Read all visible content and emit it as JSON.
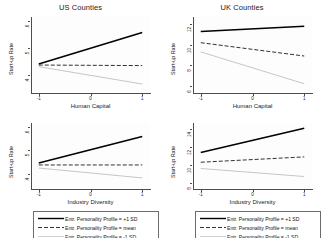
{
  "figure": {
    "background": "#ffffff",
    "panel_background": "#fdfdfd",
    "axis_color": "#4d4d4d"
  },
  "series_style": {
    "plus1sd": {
      "name": "+1 SD",
      "color": "#000000",
      "width": 1.5,
      "dash": "none"
    },
    "mean": {
      "name": "mean",
      "color": "#1a1a1a",
      "width": 0.9,
      "dash": "4 2"
    },
    "minus1sd": {
      "name": "-1 SD",
      "color": "#b8b8b8",
      "width": 0.8,
      "dash": "none"
    }
  },
  "legend": {
    "rows": [
      {
        "key": "solid-line-key",
        "label": "Entr. Personality Profile = +1 SD"
      },
      {
        "key": "dashed-line-key",
        "label": "Entr. Personality Profile = mean"
      },
      {
        "key": "light-line-key",
        "label": "Entr. Personality Profile = -1 SD"
      }
    ]
  },
  "chart_data": [
    {
      "id": "us-human-capital",
      "type": "line",
      "title": "US Counties",
      "xlabel": "Human Capital",
      "ylabel": "Start-up Rate",
      "x": [
        -1,
        1
      ],
      "xlim": [
        -1.15,
        1.15
      ],
      "xticks": [
        -1,
        0,
        1
      ],
      "xticklabels": [
        "-1",
        "0",
        "1"
      ],
      "ylim": [
        0.335,
        0.615
      ],
      "yticks": [
        0.4,
        0.5,
        0.6
      ],
      "yticklabels": [
        ".4",
        ".5",
        ".6"
      ],
      "grid": false,
      "series": [
        {
          "name": "Entr. Personality Profile = +1 SD",
          "style": "plus1sd",
          "values": [
            0.442,
            0.558
          ]
        },
        {
          "name": "Entr. Personality Profile = mean",
          "style": "mean",
          "values": [
            0.438,
            0.436
          ]
        },
        {
          "name": "Entr. Personality Profile = -1 SD",
          "style": "minus1sd",
          "values": [
            0.432,
            0.368
          ]
        }
      ]
    },
    {
      "id": "uk-human-capital",
      "type": "line",
      "title": "UK Counties",
      "xlabel": "Human Capital",
      "ylabel": "Start-up Rate",
      "x": [
        -1,
        1
      ],
      "xlim": [
        -1.15,
        1.15
      ],
      "xticks": [
        -1,
        0,
        1
      ],
      "xticklabels": [
        "-1",
        "0",
        "1"
      ],
      "ylim": [
        5.3,
        12.7
      ],
      "yticks": [
        6,
        8,
        10,
        12
      ],
      "yticklabels": [
        "6",
        "8",
        "10",
        "12"
      ],
      "grid": false,
      "series": [
        {
          "name": "Entr. Personality Profile = +1 SD",
          "style": "plus1sd",
          "values": [
            11.3,
            11.8
          ]
        },
        {
          "name": "Entr. Personality Profile = mean",
          "style": "mean",
          "values": [
            10.2,
            8.9
          ]
        },
        {
          "name": "Entr. Personality Profile = -1 SD",
          "style": "minus1sd",
          "values": [
            9.3,
            6.2
          ]
        }
      ]
    },
    {
      "id": "us-industry-diversity",
      "type": "line",
      "title": "",
      "xlabel": "Industry Diversity",
      "ylabel": "Start-up Rate",
      "x": [
        -1,
        1
      ],
      "xlim": [
        -1.15,
        1.15
      ],
      "xticks": [
        -1,
        0,
        1
      ],
      "xticklabels": [
        "-1",
        "0",
        "1"
      ],
      "ylim": [
        0.335,
        0.615
      ],
      "yticks": [
        0.4,
        0.5,
        0.6
      ],
      "yticklabels": [
        ".4",
        ".5",
        ".6"
      ],
      "grid": false,
      "series": [
        {
          "name": "Entr. Personality Profile = +1 SD",
          "style": "plus1sd",
          "values": [
            0.445,
            0.558
          ]
        },
        {
          "name": "Entr. Personality Profile = mean",
          "style": "mean",
          "values": [
            0.437,
            0.437
          ]
        },
        {
          "name": "Entr. Personality Profile = -1 SD",
          "style": "minus1sd",
          "values": [
            0.424,
            0.382
          ]
        }
      ]
    },
    {
      "id": "uk-industry-diversity",
      "type": "line",
      "title": "",
      "xlabel": "Industry Diversity",
      "ylabel": "Start-up Rate",
      "x": [
        -1,
        1
      ],
      "xlim": [
        -1.15,
        1.15
      ],
      "xticks": [
        -1,
        0,
        1
      ],
      "xticklabels": [
        "-1",
        "0",
        "1"
      ],
      "ylim": [
        7.3,
        14.7
      ],
      "yticks": [
        8,
        10,
        12,
        14
      ],
      "yticklabels": [
        "8",
        "10",
        "12",
        "14"
      ],
      "grid": false,
      "series": [
        {
          "name": "Entr. Personality Profile = +1 SD",
          "style": "plus1sd",
          "values": [
            11.4,
            14.1
          ]
        },
        {
          "name": "Entr. Personality Profile = mean",
          "style": "mean",
          "values": [
            10.3,
            10.9
          ]
        },
        {
          "name": "Entr. Personality Profile = -1 SD",
          "style": "minus1sd",
          "values": [
            9.6,
            8.7
          ]
        }
      ]
    }
  ]
}
